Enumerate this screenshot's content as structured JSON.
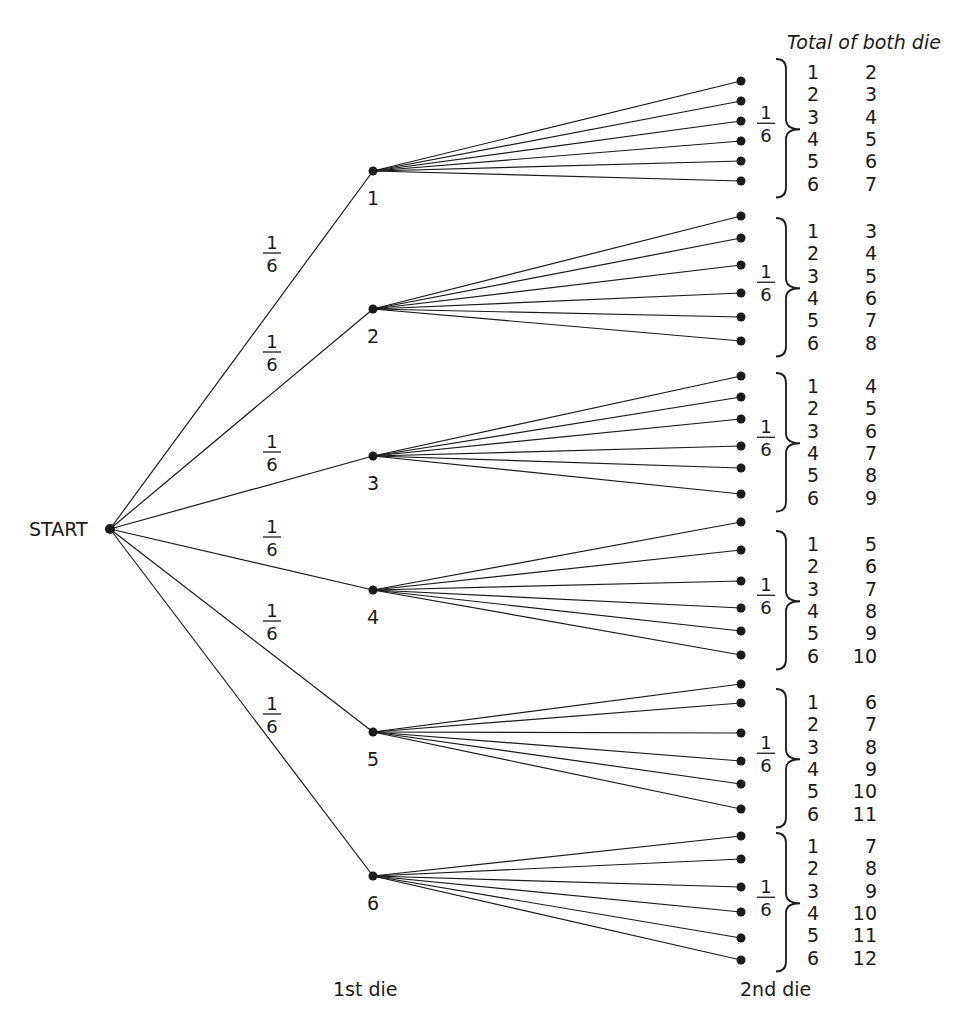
{
  "title": "Total of both die",
  "start_label": "START",
  "first_die_label": "1st die",
  "second_die_label": "2nd die",
  "branch_probability": {
    "numerator": "1",
    "denominator": "6"
  },
  "first_die": [
    {
      "value": "1",
      "second_die": [
        "1",
        "2",
        "3",
        "4",
        "5",
        "6"
      ],
      "totals": [
        "2",
        "3",
        "4",
        "5",
        "6",
        "7"
      ]
    },
    {
      "value": "2",
      "second_die": [
        "1",
        "2",
        "3",
        "4",
        "5",
        "6"
      ],
      "totals": [
        "3",
        "4",
        "5",
        "6",
        "7",
        "8"
      ]
    },
    {
      "value": "3",
      "second_die": [
        "1",
        "2",
        "3",
        "4",
        "5",
        "6"
      ],
      "totals": [
        "4",
        "5",
        "6",
        "7",
        "8",
        "9"
      ]
    },
    {
      "value": "4",
      "second_die": [
        "1",
        "2",
        "3",
        "4",
        "5",
        "6"
      ],
      "totals": [
        "5",
        "6",
        "7",
        "8",
        "9",
        "10"
      ]
    },
    {
      "value": "5",
      "second_die": [
        "1",
        "2",
        "3",
        "4",
        "5",
        "6"
      ],
      "totals": [
        "6",
        "7",
        "8",
        "9",
        "10",
        "11"
      ]
    },
    {
      "value": "6",
      "second_die": [
        "1",
        "2",
        "3",
        "4",
        "5",
        "6"
      ],
      "totals": [
        "7",
        "8",
        "9",
        "10",
        "11",
        "12"
      ]
    }
  ],
  "colors": {
    "ink": "#1a1a1a",
    "background": "#ffffff"
  }
}
